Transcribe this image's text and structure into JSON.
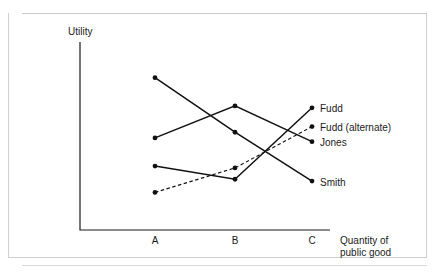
{
  "chart_data": {
    "type": "line",
    "title": "",
    "xlabel": "Quantity of public good",
    "ylabel": "Utility",
    "categories": [
      "A",
      "B",
      "C"
    ],
    "xlim": [
      0,
      1
    ],
    "ylim": [
      0,
      100
    ],
    "grid": false,
    "legend_position": "right-inline-labels",
    "axis_ticks_numeric": false,
    "series": [
      {
        "name": "Smith",
        "label": "Smith",
        "style": "solid",
        "color": "#111111",
        "values": [
          81,
          52,
          26
        ]
      },
      {
        "name": "Jones",
        "label": "Jones",
        "style": "solid",
        "color": "#111111",
        "values": [
          49,
          66,
          47
        ]
      },
      {
        "name": "Fudd",
        "label": "Fudd",
        "style": "solid",
        "color": "#111111",
        "values": [
          34,
          27,
          65
        ]
      },
      {
        "name": "Fudd (alternate)",
        "label": "Fudd (alternate)",
        "style": "dashed",
        "color": "#111111",
        "values": [
          20,
          33,
          55
        ]
      }
    ]
  },
  "axes": {
    "y_axis_title": "Utility",
    "x_axis_title_line1": "Quantity of",
    "x_axis_title_line2": "public good",
    "x_tick_a": "A",
    "x_tick_b": "B",
    "x_tick_c": "C"
  },
  "series_labels": {
    "fudd": "Fudd",
    "fudd_alternate": "Fudd (alternate)",
    "jones": "Jones",
    "smith": "Smith"
  }
}
